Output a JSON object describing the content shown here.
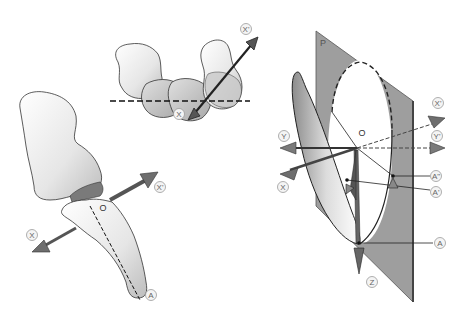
{
  "figure": {
    "panels": [
      {
        "id": "carpal-bones-top",
        "labels": {
          "x": "X",
          "x_prime": "X'"
        }
      },
      {
        "id": "trapezium-metacarpal",
        "labels": {
          "x": "X",
          "x_prime": "X'",
          "o": "O",
          "a": "A"
        }
      },
      {
        "id": "geometric-model",
        "labels": {
          "p": "P",
          "o": "O",
          "x": "X",
          "x_prime": "X'",
          "y": "Y",
          "y_prime": "Y'",
          "z": "Z",
          "a": "A",
          "a_prime": "A'",
          "a_double_prime": "A\""
        }
      }
    ]
  },
  "colors": {
    "plane": "#9a9a9a",
    "plane_edge": "#555555",
    "arrow": "#6e6e6e",
    "bone_fill": "#f2f2f2",
    "bone_shade": "#c8c8c8",
    "outline": "#333333"
  }
}
